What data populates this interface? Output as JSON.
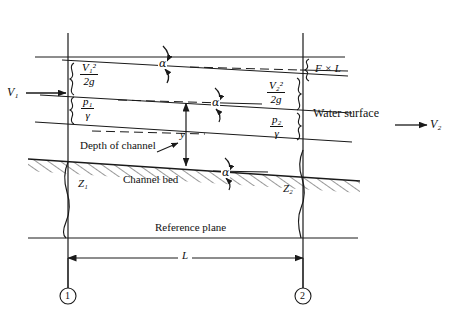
{
  "figure": {
    "type": "engineering-diagram"
  },
  "labels": {
    "v1": "V₁",
    "v2": "V₂",
    "velocity_head_1_num": "V₁²",
    "velocity_head_1_den": "2g",
    "velocity_head_2_num": "V₂²",
    "velocity_head_2_den": "2g",
    "pressure_head_1_num": "p₁",
    "pressure_head_1_den": "γ",
    "pressure_head_2_num": "p₂",
    "pressure_head_2_den": "γ",
    "head_loss": "F × L",
    "water_surface": "Water surface",
    "depth_of_channel": "Depth of channel",
    "depth_symbol": "y",
    "channel_bed": "Channel bed",
    "reference_plane": "Reference plane",
    "length": "L",
    "z1": "Z₁",
    "z2": "Z₂",
    "alpha_top": "α",
    "alpha_middle": "α",
    "alpha_bed": "α",
    "station_1": "1",
    "station_2": "2"
  },
  "colors": {
    "line": "#1a1a1a",
    "text": "#111111",
    "background": "#ffffff"
  },
  "geometry": {
    "station_1_x": 68,
    "station_2_x": 303,
    "energy_line_left_y": 60,
    "energy_line_right_y": 75,
    "horizontal_datum_top_y": 57,
    "water_surface_left_y": 97,
    "water_surface_right_y": 112,
    "channel_bed_left_y": 160,
    "channel_bed_right_y": 180,
    "reference_plane_y": 238,
    "length_dimension_y": 258,
    "station_marker_y": 297
  }
}
